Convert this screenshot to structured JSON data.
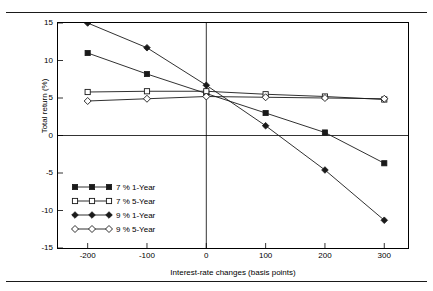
{
  "chart_data": {
    "type": "line",
    "title": "",
    "xlabel": "Interest-rate changes (basis points)",
    "ylabel": "Total return (%)",
    "x": [
      -200,
      -100,
      0,
      100,
      200,
      300
    ],
    "xticks": [
      "-200",
      "-100",
      "0",
      "100",
      "200",
      "300"
    ],
    "yticks": [
      "15",
      "10",
      "5",
      "0",
      "-5",
      "-10",
      "-15"
    ],
    "xlim": [
      -250,
      340
    ],
    "ylim": [
      -15,
      15
    ],
    "grid": false,
    "legend_position": "lower-left-inside",
    "zero_line": true,
    "series": [
      {
        "name": "7 % 1-Year",
        "marker": "filled-square",
        "values": [
          11.0,
          8.2,
          5.6,
          3.0,
          0.4,
          -3.7
        ]
      },
      {
        "name": "7 % 5-Year",
        "marker": "open-square",
        "values": [
          5.8,
          5.9,
          5.9,
          5.5,
          5.2,
          4.8
        ]
      },
      {
        "name": "9 % 1-Year",
        "marker": "filled-diamond",
        "values": [
          15.0,
          11.7,
          6.7,
          1.3,
          -4.6,
          -11.3
        ]
      },
      {
        "name": "9 % 5-Year",
        "marker": "open-diamond",
        "values": [
          4.6,
          4.9,
          5.2,
          5.1,
          5.0,
          4.9
        ]
      }
    ]
  },
  "colors": {
    "axis": "#000000",
    "line": "#1a1a1a",
    "background": "#ffffff"
  }
}
